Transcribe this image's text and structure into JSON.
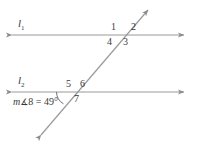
{
  "figure": {
    "type": "geometry-diagram",
    "stroke_color": "#8c8c8c",
    "text_color": "#3a3a3a",
    "background_color": "#ffffff"
  },
  "lines": {
    "upper": {
      "label": "l",
      "subscript": "1",
      "y": 35,
      "x_start": 8,
      "x_end": 188
    },
    "lower": {
      "label": "l",
      "subscript": "2",
      "y": 92,
      "x_start": 8,
      "x_end": 188
    },
    "transversal": {
      "x_start": 37,
      "y_start": 140,
      "x_end": 152,
      "y_end": 6
    }
  },
  "intersections": {
    "upper": {
      "x": 122,
      "y": 35
    },
    "lower": {
      "x": 70,
      "y": 92
    }
  },
  "angle_labels": [
    {
      "id": "1",
      "text": "1",
      "x": 111,
      "y": 22
    },
    {
      "id": "2",
      "text": "2",
      "x": 131,
      "y": 22
    },
    {
      "id": "3",
      "text": "3",
      "x": 123,
      "y": 37
    },
    {
      "id": "4",
      "text": "4",
      "x": 107,
      "y": 37
    },
    {
      "id": "5",
      "text": "5",
      "x": 66,
      "y": 79
    },
    {
      "id": "6",
      "text": "6",
      "x": 80,
      "y": 79
    },
    {
      "id": "7",
      "text": "7",
      "x": 74,
      "y": 94
    },
    {
      "id": "8",
      "text": "",
      "x": 0,
      "y": 0
    }
  ],
  "measure": {
    "prefix": "m",
    "angle_symbol": "∡",
    "angle_number": "8",
    "equals": "=",
    "value": "49",
    "degree": "°",
    "full_text": "m∡8 = 49°",
    "x": 13,
    "y": 98
  },
  "arc": {
    "name": "angle-8-arc",
    "center_x": 70,
    "center_y": 92,
    "radius": 14
  }
}
